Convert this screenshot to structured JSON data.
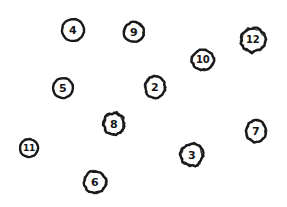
{
  "canvas": {
    "width": 287,
    "height": 207,
    "background_color": "#ffffff",
    "ink_color": "#1a1a1a",
    "label_color": "#151515",
    "description": "hand-drawn sketch of eleven numbered circles scattered on a white page"
  },
  "nodes": [
    {
      "label": "4",
      "cx": 73,
      "cy": 30,
      "rx": 12,
      "ry": 12,
      "font_size": 11,
      "rotate": -4,
      "wobble": 0
    },
    {
      "label": "9",
      "cx": 134,
      "cy": 32,
      "rx": 11,
      "ry": 11,
      "font_size": 11,
      "rotate": 3,
      "wobble": 1
    },
    {
      "label": "12",
      "cx": 253,
      "cy": 40,
      "rx": 13,
      "ry": 13,
      "font_size": 10,
      "rotate": -2,
      "wobble": 2
    },
    {
      "label": "10",
      "cx": 203,
      "cy": 60,
      "rx": 12,
      "ry": 11,
      "font_size": 10,
      "rotate": 4,
      "wobble": 1
    },
    {
      "label": "5",
      "cx": 63,
      "cy": 88,
      "rx": 11,
      "ry": 11,
      "font_size": 11,
      "rotate": -3,
      "wobble": 0
    },
    {
      "label": "2",
      "cx": 155,
      "cy": 87,
      "rx": 11,
      "ry": 12,
      "font_size": 11,
      "rotate": 2,
      "wobble": 1
    },
    {
      "label": "8",
      "cx": 114,
      "cy": 124,
      "rx": 11,
      "ry": 12,
      "font_size": 11,
      "rotate": -5,
      "wobble": 2
    },
    {
      "label": "7",
      "cx": 256,
      "cy": 131,
      "rx": 11,
      "ry": 12,
      "font_size": 11,
      "rotate": 3,
      "wobble": 1
    },
    {
      "label": "11",
      "cx": 29,
      "cy": 148,
      "rx": 10,
      "ry": 10,
      "font_size": 9,
      "rotate": -2,
      "wobble": 0
    },
    {
      "label": "3",
      "cx": 192,
      "cy": 155,
      "rx": 12,
      "ry": 12,
      "font_size": 11,
      "rotate": 5,
      "wobble": 2
    },
    {
      "label": "6",
      "cx": 95,
      "cy": 182,
      "rx": 12,
      "ry": 12,
      "font_size": 11,
      "rotate": -3,
      "wobble": 1
    }
  ]
}
